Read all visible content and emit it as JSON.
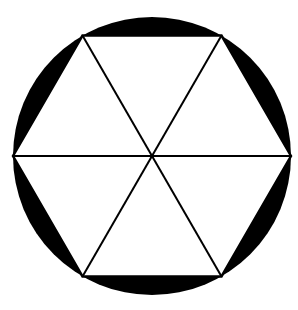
{
  "figure": {
    "name": "circle-with-inscribed-hexagon",
    "title": "Black circle with inscribed white hexagon divided into six triangles",
    "canvas": {
      "width": 298,
      "height": 310,
      "background_color": "#ffffff"
    },
    "colors": {
      "fill_black": "#000000",
      "fill_white": "#ffffff",
      "stroke": "#000000"
    },
    "circle": {
      "center_x": 152,
      "center_y": 156,
      "radius": 139,
      "fill": "#000000"
    },
    "hexagon": {
      "sides": 6,
      "circumradius": 139,
      "fill": "#ffffff",
      "rotation_degrees": 0,
      "vertices": [
        {
          "label": "right",
          "x": 291,
          "y": 156
        },
        {
          "label": "top-right",
          "x": 221.5,
          "y": 35.6
        },
        {
          "label": "top-left",
          "x": 82.5,
          "y": 35.6
        },
        {
          "label": "left",
          "x": 13,
          "y": 156
        },
        {
          "label": "bottom-left",
          "x": 82.5,
          "y": 276.4
        },
        {
          "label": "bottom-right",
          "x": 221.5,
          "y": 276.4
        }
      ]
    },
    "diagonals": [
      {
        "name": "horizontal-diameter",
        "from": "left",
        "to": "right",
        "stroke_width": 2
      },
      {
        "name": "diagonal-upper-left-to-lower-right",
        "from": "top-left",
        "to": "bottom-right",
        "stroke_width": 2
      },
      {
        "name": "diagonal-upper-right-to-lower-left",
        "from": "top-right",
        "to": "bottom-left",
        "stroke_width": 2
      }
    ],
    "triangle_count": 6,
    "segment_count": 6
  }
}
